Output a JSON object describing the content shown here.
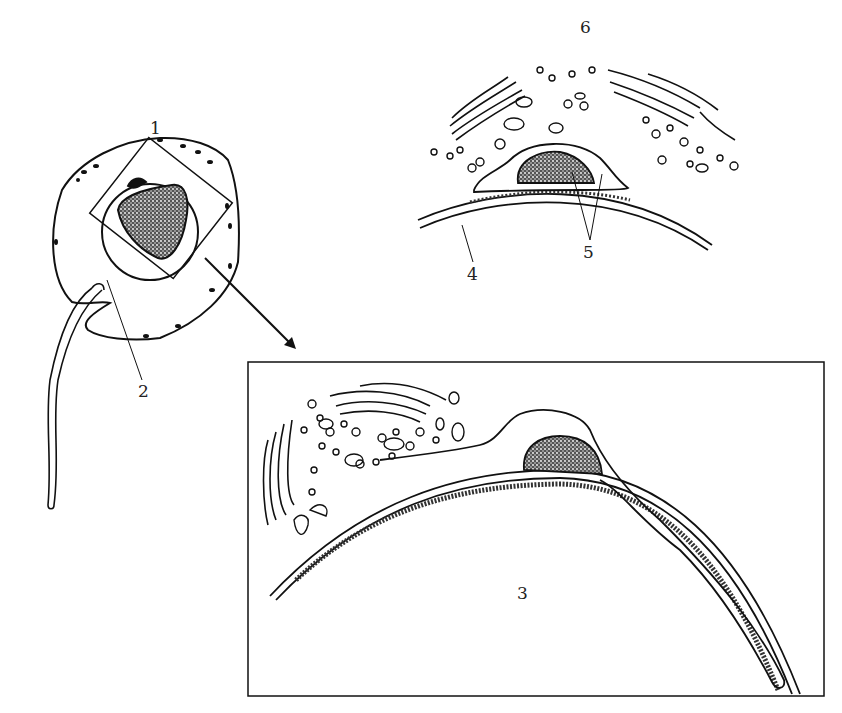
{
  "diagram": {
    "labels": {
      "l1": "1",
      "l2": "2",
      "l3": "3",
      "l4": "4",
      "l5": "5",
      "l6": "6"
    },
    "colors": {
      "ink": "#111111",
      "background": "#ffffff"
    }
  }
}
